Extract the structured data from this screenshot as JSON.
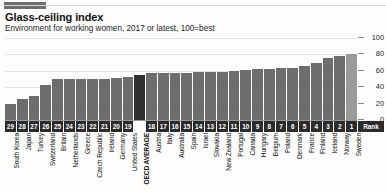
{
  "header": {
    "brand_tab": "economist-red-tab",
    "title": "Glass-ceiling index",
    "subtitle": "Environment for working women, 2017 or latest, 100=best"
  },
  "axis": {
    "rank_label": "Rank",
    "y_ticks": [
      "100",
      "80",
      "60",
      "40",
      "20",
      "0"
    ]
  },
  "colors": {
    "bar": "#6d6d6d",
    "bar_oecd": "#303030",
    "bar_top": "#9a9a9a",
    "rank_box": "#2b2b2b",
    "gridline": "#e3e3e3",
    "baseline": "#9a9a9a"
  },
  "chart_data": {
    "type": "bar",
    "title": "Glass-ceiling index",
    "subtitle": "Environment for working women, 2017 or latest, 100=best",
    "xlabel": "",
    "ylabel": "",
    "ylim": [
      0,
      100
    ],
    "yticks": [
      0,
      20,
      40,
      60,
      80,
      100
    ],
    "grid": true,
    "legend": false,
    "categories": [
      "South Korea",
      "Japan",
      "Turkey",
      "Switzerland",
      "Britain",
      "Netherlands",
      "Greece",
      "Czech Republic",
      "Ireland",
      "Germany",
      "United States",
      "OECD AVERAGE",
      "Austria",
      "Italy",
      "Australia",
      "Spain",
      "Israel",
      "Slovakia",
      "New Zealand",
      "Portugal",
      "Canada",
      "Hungary",
      "Belgium",
      "Poland",
      "Denmark",
      "France",
      "Finland",
      "Iceland",
      "Norway",
      "Sweden"
    ],
    "values": [
      20,
      26,
      29,
      43,
      50,
      50,
      50,
      50,
      50,
      51,
      53,
      55,
      57,
      57,
      57,
      57,
      58,
      58,
      59,
      60,
      61,
      62,
      62,
      64,
      64,
      66,
      69,
      76,
      78,
      80
    ],
    "ranks": [
      "29",
      "28",
      "27",
      "26",
      "25",
      "24",
      "23",
      "22",
      "21",
      "20",
      "19",
      "",
      "18",
      "17",
      "16",
      "15",
      "14",
      "13",
      "12",
      "11",
      "10",
      "9",
      "8",
      "7",
      "6",
      "5",
      "4",
      "3",
      "2",
      "1"
    ],
    "highlight": {
      "oecd_average_index": 11,
      "top_bar_index": 29
    }
  }
}
